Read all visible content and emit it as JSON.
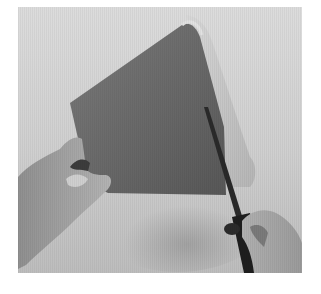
{
  "image": {
    "subject": "hands cutting a paper cone with scissors",
    "style": "grayscale photograph",
    "colors": {
      "page_background": "#ffffff",
      "backdrop_light": "#d6d6d6",
      "backdrop_mid": "#b8b8b8",
      "cone_dark": "#6a6a6a",
      "cone_shadow": "#555555",
      "cone_inner": "#c9c9c9",
      "skin": "#a9a9a9",
      "skin_shadow": "#7d7d7d",
      "scissors": "#1e1e1e"
    }
  }
}
